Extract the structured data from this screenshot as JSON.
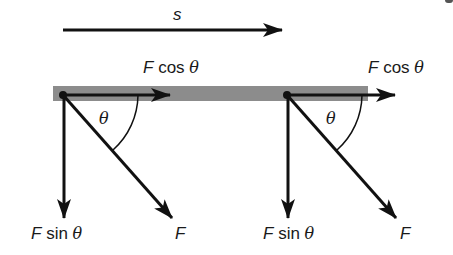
{
  "diagram": {
    "colors": {
      "ink": "#111111",
      "surface_bar": "#8c8c8c",
      "background": "#ffffff"
    },
    "displacement": {
      "label": "s",
      "from": [
        63,
        30
      ],
      "to": [
        282,
        30
      ]
    },
    "surface": {
      "x": 53,
      "y": 86,
      "width": 315,
      "height": 15
    },
    "panels": [
      {
        "origin": [
          63,
          95
        ],
        "horizontal_component": {
          "label_F": "F",
          "label_fn": "cos",
          "label_theta": "θ",
          "tip": [
            170,
            95
          ]
        },
        "vertical_component": {
          "label_F": "F",
          "label_fn": "sin",
          "label_theta": "θ",
          "tip": [
            64,
            218
          ]
        },
        "force": {
          "label": "F",
          "tip": [
            172,
            218
          ]
        },
        "angle": {
          "label": "θ"
        }
      },
      {
        "origin": [
          287,
          95
        ],
        "horizontal_component": {
          "label_F": "F",
          "label_fn": "cos",
          "label_theta": "θ",
          "tip": [
            395,
            95
          ]
        },
        "vertical_component": {
          "label_F": "F",
          "label_fn": "sin",
          "label_theta": "θ",
          "tip": [
            288,
            218
          ]
        },
        "force": {
          "label": "F",
          "tip": [
            396,
            218
          ]
        },
        "angle": {
          "label": "θ"
        }
      }
    ]
  }
}
